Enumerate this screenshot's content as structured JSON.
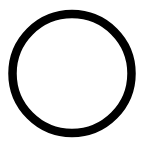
{
  "shape": {
    "icon": "circle-outline-icon",
    "center_x": 72,
    "center_y": 73.5,
    "radius": 59.5,
    "stroke_width": 8.5,
    "stroke_color": "#000000",
    "fill_color": "#ffffff"
  },
  "background_color": "#ffffff"
}
